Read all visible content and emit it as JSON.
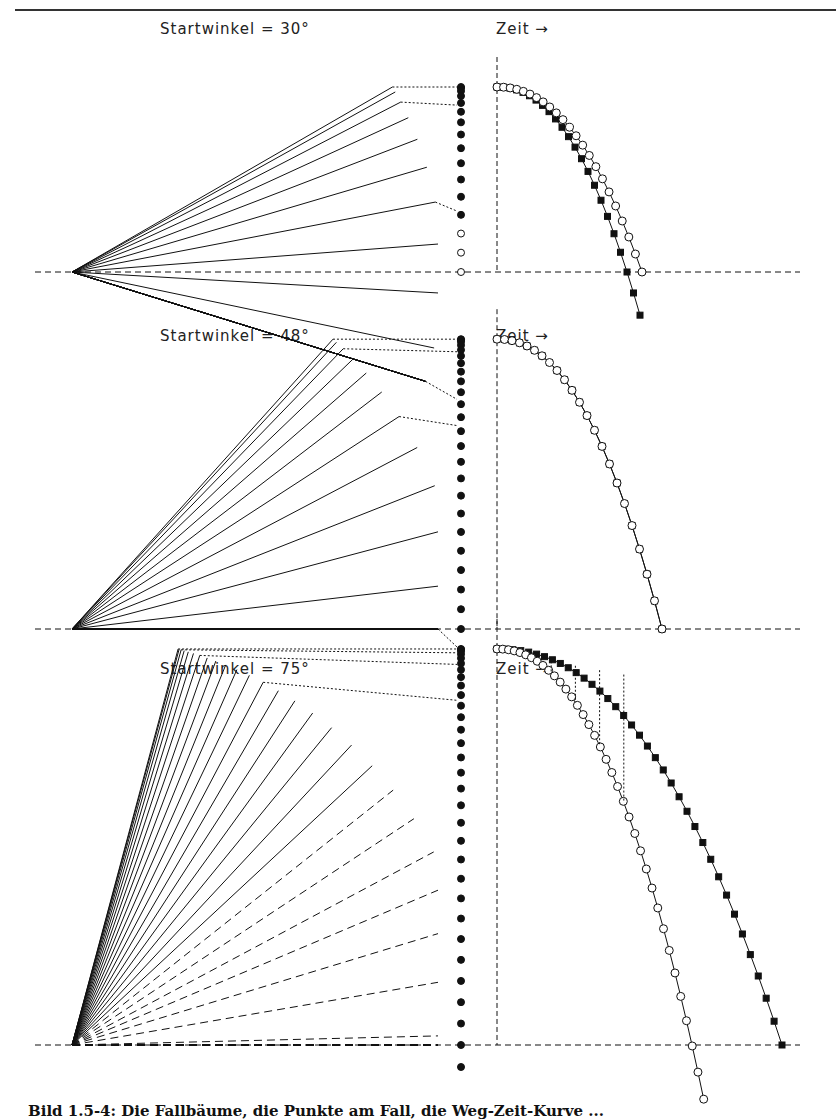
{
  "figure": {
    "panels": [
      {
        "id": "top",
        "title": "Startwinkel = 30°",
        "time_label": "Zeit →",
        "angle_deg": 30
      },
      {
        "id": "middle",
        "title": "Startwinkel = 48°",
        "time_label": "Zeit →",
        "angle_deg": 48
      },
      {
        "id": "bottom",
        "title": "Startwinkel = 75°",
        "time_label": "Zeit →",
        "angle_deg": 75
      }
    ],
    "caption": "Bild 1.5-4: Die Fallbäume, die Punkte am Fall, die Weg-Zeit-Kurve ...",
    "legend_hint": {
      "filled_square_series": "Weg-Zeit (filled squares)",
      "open_circle_series": "Weg-Zeit (open circles)"
    },
    "colors": {
      "ink": "#111111",
      "background": "#ffffff"
    }
  }
}
